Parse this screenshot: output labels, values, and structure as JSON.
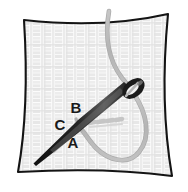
{
  "illustration": {
    "title": "Embroidery Stitch Diagram",
    "subject": "needle-and-thread-on-fabric",
    "background_color": "#ffffff"
  },
  "fabric": {
    "name": "woven-fabric-swatch",
    "fill_color": "#fbfbfb",
    "outline_color": "#141414",
    "weave_color": "#e4e4e4",
    "weave_color_alt": "#ededed",
    "outline_width": 2.1,
    "corners": {
      "top_left": [
        24,
        20
      ],
      "top_right": [
        168,
        14
      ],
      "bottom_right": [
        172,
        176
      ],
      "bottom_left": [
        18,
        172
      ]
    }
  },
  "needle": {
    "name": "sewing-needle",
    "body_color": "#1c1c1c",
    "highlight_color": "#6d6d6d",
    "eye_color": "#f4f4f4",
    "tip_point": [
      34,
      163
    ],
    "eye_point": [
      130,
      88
    ],
    "angle_note": "lower-left to upper-right"
  },
  "thread": {
    "name": "embroidery-thread",
    "color": "#b9b9b9",
    "shadow_color": "#a3a3a3",
    "width": 3.4,
    "enters_top_at": [
      109,
      12
    ],
    "loops_through_eye": true,
    "loop_bottom": [
      122,
      156
    ]
  },
  "stitches": {
    "name": "existing-stitch-marks",
    "color": "#c9c9c9",
    "count": 5,
    "start": [
      88,
      122
    ],
    "end": [
      124,
      118
    ]
  },
  "labels": [
    {
      "id": "label-b",
      "text": "B",
      "x": 76,
      "y": 113,
      "role": "needle-entry-point"
    },
    {
      "id": "label-c",
      "text": "C",
      "x": 60,
      "y": 130,
      "role": "thread-crossing-point"
    },
    {
      "id": "label-a",
      "text": "A",
      "x": 73,
      "y": 148,
      "role": "thread-emergence-point"
    }
  ]
}
